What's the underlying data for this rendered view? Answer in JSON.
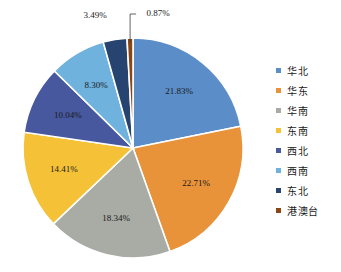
{
  "chart_data": {
    "type": "pie",
    "title": "",
    "categories": [
      "华北",
      "华东",
      "华南",
      "东南",
      "西北",
      "西南",
      "东北",
      "港澳台"
    ],
    "values": [
      21.83,
      22.71,
      18.34,
      14.41,
      10.04,
      8.3,
      3.49,
      0.87
    ],
    "value_labels": [
      "21.83%",
      "22.71%",
      "18.34%",
      "14.41%",
      "10.04%",
      "8.30%",
      "3.49%",
      "0.87%"
    ],
    "colors": [
      "#5B8DC8",
      "#E8923A",
      "#A9ABA5",
      "#F5C237",
      "#47589E",
      "#6FB2DE",
      "#27436F",
      "#8A4613"
    ],
    "legend_position": "right",
    "start_angle_deg": 0,
    "direction": "clockwise",
    "callout_slices": [
      "港澳台"
    ],
    "unit": "%"
  },
  "legend": {
    "items": [
      {
        "label": "华北",
        "color": "#5B8DC8"
      },
      {
        "label": "华东",
        "color": "#E8923A"
      },
      {
        "label": "华南",
        "color": "#A9ABA5"
      },
      {
        "label": "东南",
        "color": "#F5C237"
      },
      {
        "label": "西北",
        "color": "#47589E"
      },
      {
        "label": "西南",
        "color": "#6FB2DE"
      },
      {
        "label": "东北",
        "color": "#27436F"
      },
      {
        "label": "港澳台",
        "color": "#8A4613"
      }
    ]
  },
  "geometry": {
    "center_x": 133,
    "center_y": 148,
    "radius": 110,
    "label_radius_ratio": 0.66
  }
}
